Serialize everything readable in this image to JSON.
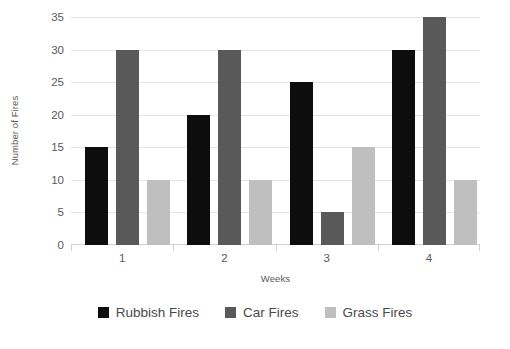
{
  "chart_data": {
    "type": "bar",
    "title": "",
    "subtitle": "",
    "xlabel": "Weeks",
    "ylabel": "Number of Fires",
    "categories": [
      "1",
      "2",
      "3",
      "4"
    ],
    "series": [
      {
        "name": "Rubbish Fires",
        "color": "#0d0d0d",
        "values": [
          15,
          20,
          25,
          30
        ]
      },
      {
        "name": "Car Fires",
        "color": "#595959",
        "values": [
          30,
          30,
          5,
          35
        ]
      },
      {
        "name": "Grass Fires",
        "color": "#bfbfbf",
        "values": [
          10,
          10,
          15,
          10
        ]
      }
    ],
    "ylim": [
      0,
      35
    ],
    "ytick_values": [
      0,
      5,
      10,
      15,
      20,
      25,
      30,
      35
    ],
    "ytick_labels": [
      "0",
      "5",
      "10",
      "15",
      "20",
      "25",
      "30",
      "35"
    ],
    "grid": true,
    "grid_color": "#e4e4e4",
    "legend_position": "bottom",
    "background": "#ffffff",
    "axis_text_color": "#5a5a5a"
  }
}
